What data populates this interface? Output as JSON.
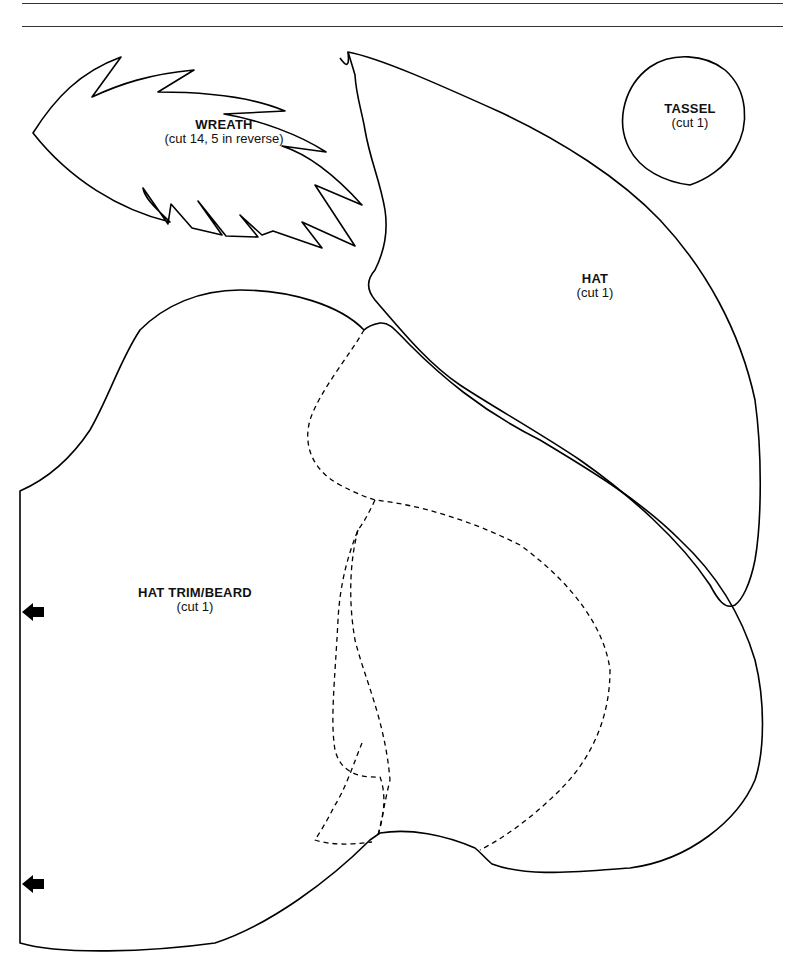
{
  "page": {
    "type": "sewing pattern sheet",
    "line_color": "#000000",
    "background": "#ffffff"
  },
  "pieces": [
    {
      "id": "wreath",
      "title": "WREATH",
      "instruction": "(cut 14, 5 in reverse)"
    },
    {
      "id": "tassel",
      "title": "TASSEL",
      "instruction": "(cut 1)"
    },
    {
      "id": "hat",
      "title": "HAT",
      "instruction": "(cut 1)"
    },
    {
      "id": "hat-trim-beard",
      "title": "HAT TRIM/BEARD",
      "instruction": "(cut 1)"
    }
  ],
  "markers": [
    {
      "type": "arrow-left",
      "meaning": "place on fold",
      "count": 2
    }
  ]
}
